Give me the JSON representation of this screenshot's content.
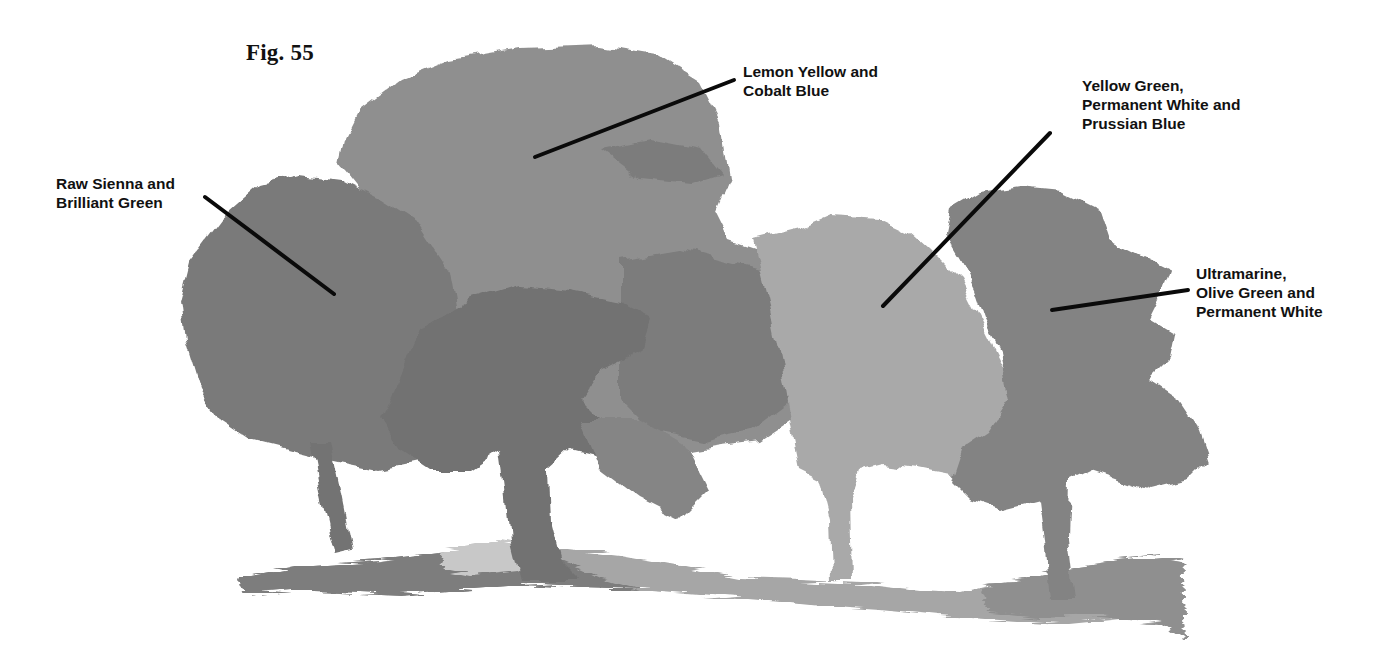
{
  "figure": {
    "number": "Fig. 55"
  },
  "labels": [
    {
      "id": "raw-sienna",
      "text": "Raw Sienna and\nBrilliant Green",
      "tree": "left tree",
      "pointer": {
        "x1": 205,
        "y1": 197,
        "x2": 334,
        "y2": 294
      }
    },
    {
      "id": "lemon-yellow",
      "text": "Lemon Yellow and\nCobalt Blue",
      "tree": "large center-left tree",
      "pointer": {
        "x1": 734,
        "y1": 80,
        "x2": 535,
        "y2": 157
      }
    },
    {
      "id": "yellow-green",
      "text": "Yellow Green,\nPermanent White and\nPrussian Blue",
      "tree": "light center-right tree",
      "pointer": {
        "x1": 1050,
        "y1": 133,
        "x2": 883,
        "y2": 306
      }
    },
    {
      "id": "ultramarine",
      "text": "Ultramarine,\nOlive Green and\nPermanent White",
      "tree": "right tree",
      "pointer": {
        "x1": 1188,
        "y1": 290,
        "x2": 1052,
        "y2": 310
      }
    }
  ],
  "colors": {
    "background": "#ffffff",
    "tree_raw_sienna": "#7a7a7a",
    "tree_lemon_yellow": "#8f8f8f",
    "tree_dark_shadow": "#6e6e6e",
    "tree_yellow_green": "#a9a9a9",
    "tree_ultramarine": "#838383",
    "ground_left": "#7d7d7d",
    "ground_right": "#a8a8a8",
    "pointer_line": "#0a0a0a",
    "text": "#111111"
  }
}
